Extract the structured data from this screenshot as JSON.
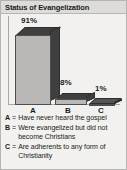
{
  "chart_data": {
    "type": "bar",
    "title": "Status of Evangelization",
    "categories": [
      "A",
      "B",
      "C"
    ],
    "values": [
      91,
      8,
      1
    ],
    "value_labels": [
      "91%",
      "8%",
      "1%"
    ],
    "xlabel": "",
    "ylabel": "",
    "ylim": [
      0,
      100
    ],
    "grid": false,
    "legend_position": "below",
    "legend": [
      {
        "key": "A",
        "separator": "=",
        "description": "Have never heard the gospel"
      },
      {
        "key": "B",
        "separator": "=",
        "description": "Were evangelized but did not become Christians"
      },
      {
        "key": "C",
        "separator": "=",
        "description": "Are adherents to any form of Christianity"
      }
    ],
    "colors": {
      "bar_front": "#b9b8b6",
      "bar_shade": "#3f3f3f",
      "panel_background": "#f2f1ef",
      "title_band": "#dedcd8",
      "border": "#b4b4b4",
      "text": "#1b1b1b"
    }
  }
}
